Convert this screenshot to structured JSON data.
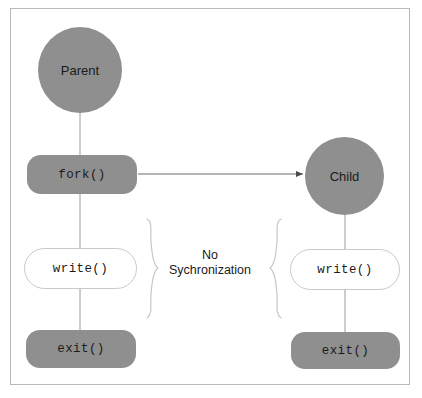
{
  "diagram": {
    "frame": {
      "border_color": "#b8b8b8",
      "background_color": "#ffffff"
    },
    "colors": {
      "node_fill_gray": "#8f8f8f",
      "node_outline_gray": "#c9c9c9",
      "text": "#1b1b1b",
      "connector": "#9a9a9a",
      "bracket": "#c6c6c6",
      "arrow": "#4a4a4a"
    },
    "nodes": {
      "parent": {
        "label": "Parent",
        "shape": "circle",
        "fill": "gray"
      },
      "fork": {
        "label": "fork()",
        "shape": "rounded-rect",
        "fill": "gray"
      },
      "write_parent": {
        "label": "write()",
        "shape": "stadium",
        "fill": "white"
      },
      "exit_parent": {
        "label": "exit()",
        "shape": "rounded-rect",
        "fill": "gray"
      },
      "child": {
        "label": "Child",
        "shape": "circle",
        "fill": "gray"
      },
      "write_child": {
        "label": "write()",
        "shape": "stadium",
        "fill": "white"
      },
      "exit_child": {
        "label": "exit()",
        "shape": "rounded-rect",
        "fill": "gray"
      }
    },
    "caption": {
      "line1": "No",
      "line2": "Sychronization"
    },
    "edges": [
      {
        "name": "parent-to-fork",
        "from": "parent",
        "to": "fork",
        "style": "line"
      },
      {
        "name": "fork-to-child",
        "from": "fork",
        "to": "child",
        "style": "arrow"
      },
      {
        "name": "fork-to-write-parent",
        "from": "fork",
        "to": "write_parent",
        "style": "line"
      },
      {
        "name": "write-parent-to-exit-parent",
        "from": "write_parent",
        "to": "exit_parent",
        "style": "line"
      },
      {
        "name": "child-to-write-child",
        "from": "child",
        "to": "write_child",
        "style": "line"
      },
      {
        "name": "write-child-to-exit-child",
        "from": "write_child",
        "to": "exit_child",
        "style": "line"
      }
    ],
    "brackets": [
      {
        "name": "left-brace",
        "direction": "right-facing",
        "glyph": "}"
      },
      {
        "name": "right-brace",
        "direction": "left-facing",
        "glyph": "{"
      }
    ]
  }
}
